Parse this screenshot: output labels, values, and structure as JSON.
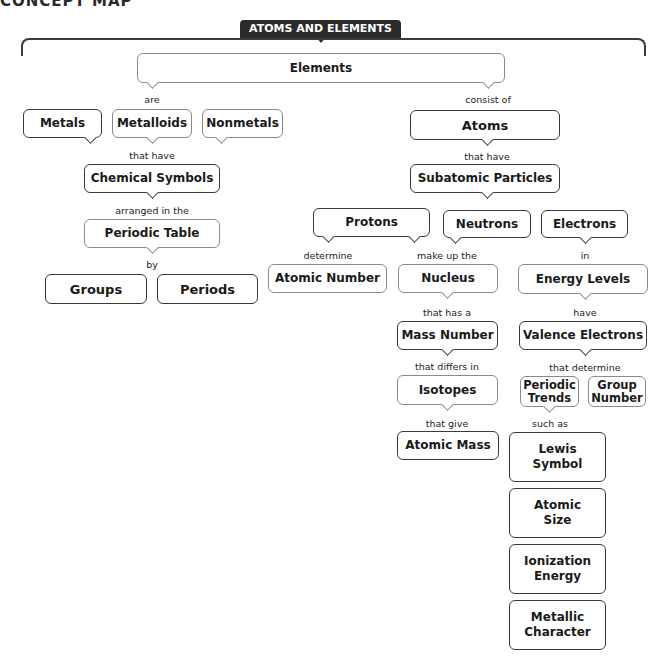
{
  "page": {
    "title_partial": "CONCEPT MAP"
  },
  "banner": {
    "label": "ATOMS AND ELEMENTS"
  },
  "nodes": {
    "elements": "Elements",
    "metals": "Metals",
    "metalloids": "Metalloids",
    "nonmetals": "Nonmetals",
    "chemical_symbols": "Chemical Symbols",
    "periodic_table": "Periodic Table",
    "groups": "Groups",
    "periods": "Periods",
    "atoms": "Atoms",
    "subatomic_particles": "Subatomic Particles",
    "protons": "Protons",
    "neutrons": "Neutrons",
    "electrons": "Electrons",
    "atomic_number": "Atomic Number",
    "nucleus": "Nucleus",
    "energy_levels": "Energy Levels",
    "mass_number": "Mass Number",
    "valence_electrons": "Valence Electrons",
    "isotopes": "Isotopes",
    "periodic_trends": "Periodic Trends",
    "group_number": "Group Number",
    "atomic_mass": "Atomic Mass",
    "lewis_symbol": "Lewis Symbol",
    "atomic_size": "Atomic Size",
    "ionization_energy": "Ionization Energy",
    "metallic_character": "Metallic Character"
  },
  "links": {
    "are": "are",
    "consist_of": "consist of",
    "that_have_1": "that have",
    "that_have_2": "that have",
    "arranged_in_the": "arranged in the",
    "by": "by",
    "determine": "determine",
    "make_up_the": "make up the",
    "in": "in",
    "that_has_a": "that has a",
    "have": "have",
    "that_differs_in": "that differs in",
    "that_determine": "that determine",
    "that_give": "that give",
    "such_as": "such as"
  }
}
